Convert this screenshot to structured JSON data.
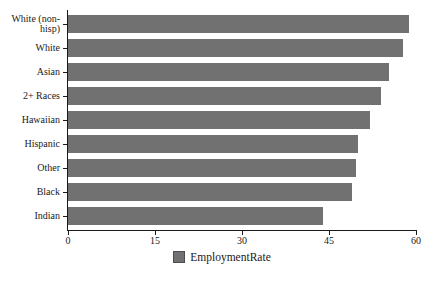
{
  "chart_data": {
    "type": "bar",
    "orientation": "horizontal",
    "title": "",
    "xlabel": "",
    "ylabel": "",
    "categories": [
      "White (non-hisp)",
      "White",
      "Asian",
      "2+ Races",
      "Hawaiian",
      "Hispanic",
      "Other",
      "Black",
      "Indian"
    ],
    "series": [
      {
        "name": "EmploymentRate",
        "values": [
          58.8,
          57.7,
          55.3,
          54.0,
          52.0,
          50.0,
          49.6,
          49.0,
          44.0
        ]
      }
    ],
    "xlim": [
      0,
      60
    ],
    "x_ticks": [
      0,
      15,
      30,
      45,
      60
    ],
    "grid": "off",
    "bar_color": "#717171",
    "legend": {
      "label": "EmploymentRate",
      "position": "bottom-center",
      "swatch_color": "#717171",
      "swatch_border_color": "#4d4d4d"
    }
  }
}
